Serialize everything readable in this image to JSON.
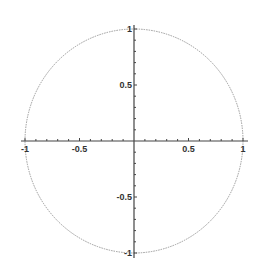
{
  "chart_data": {
    "type": "line",
    "title": "",
    "xlabel": "",
    "ylabel": "",
    "xlim": [
      -1,
      1
    ],
    "ylim": [
      -1,
      1
    ],
    "grid": false,
    "series": [
      {
        "name": "unit circle",
        "equation": "x^2 + y^2 = 1",
        "color": "#9a9a9a"
      }
    ],
    "x_ticks": [
      {
        "value": -1,
        "label": "-1"
      },
      {
        "value": -0.5,
        "label": "-0.5"
      },
      {
        "value": 0.5,
        "label": "0.5"
      },
      {
        "value": 1,
        "label": "1"
      }
    ],
    "y_ticks": [
      {
        "value": 1,
        "label": "1"
      },
      {
        "value": 0.5,
        "label": "0.5"
      },
      {
        "value": -0.5,
        "label": "-0.5"
      },
      {
        "value": -1,
        "label": "-1"
      }
    ],
    "minor_tick_step": 0.1,
    "axis_color": "#444444"
  }
}
